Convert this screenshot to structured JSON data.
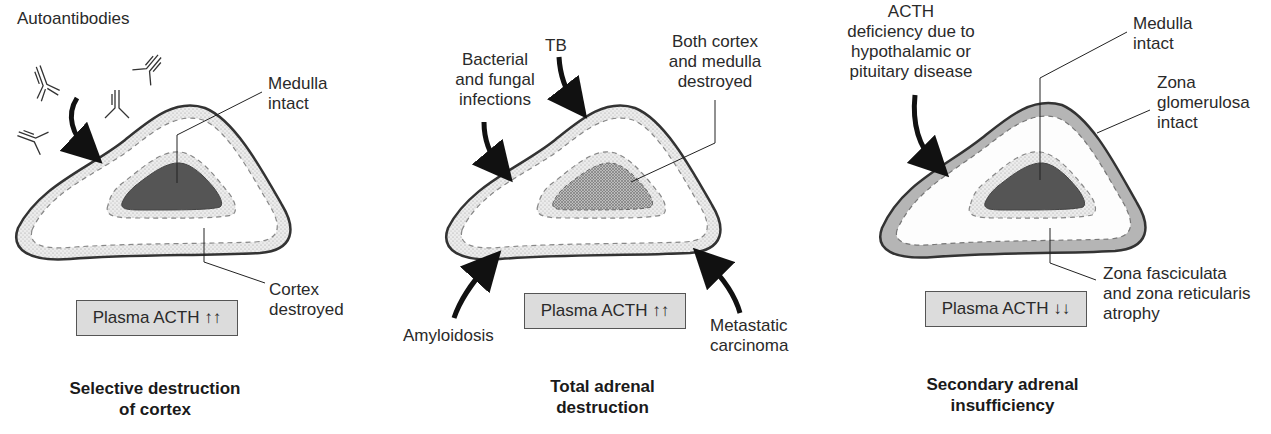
{
  "panels": [
    {
      "title_line1": "Selective destruction",
      "title_line2": "of cortex",
      "box": "Plasma ACTH ↑↑",
      "labels": {
        "cause": "Autoantibodies",
        "medulla_l1": "Medulla",
        "medulla_l2": "intact",
        "cortex_l1": "Cortex",
        "cortex_l2": "destroyed"
      }
    },
    {
      "title_line1": "Total adrenal",
      "title_line2": "destruction",
      "box": "Plasma ACTH ↑↑",
      "labels": {
        "cause1_l1": "Bacterial",
        "cause1_l2": "and fungal",
        "cause1_l3": "infections",
        "cause2": "TB",
        "both_l1": "Both cortex",
        "both_l2": "and medulla",
        "both_l3": "destroyed",
        "cause3": "Amyloidosis",
        "cause4_l1": "Metastatic",
        "cause4_l2": "carcinoma"
      }
    },
    {
      "title_line1": "Secondary adrenal",
      "title_line2": "insufficiency",
      "box": "Plasma ACTH ↓↓",
      "labels": {
        "cause_l1": "ACTH",
        "cause_l2": "deficiency due to",
        "cause_l3": "hypothalamic or",
        "cause_l4": "pituitary disease",
        "medulla_l1": "Medulla",
        "medulla_l2": "intact",
        "zg_l1": "Zona",
        "zg_l2": "glomerulosa",
        "zg_l3": "intact",
        "zf_l1": "Zona fasciculata",
        "zf_l2": "and zona reticularis",
        "zf_l3": "atrophy"
      }
    }
  ],
  "colors": {
    "outline": "#333333",
    "cortex_stipple": "#e4e4e4",
    "medulla_dark": "#555555",
    "zona_glomerulosa": "#b5b5b5",
    "box_fill": "#dcdcdc"
  }
}
